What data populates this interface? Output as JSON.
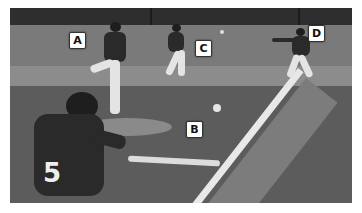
{
  "image": {
    "description": "Grayscale photo of a baseball game: batter wearing number 5 in foreground, pitcher on mound, fielders in background, with lettered callout labels",
    "batter_number": "5",
    "labels": [
      {
        "id": "A",
        "text": "A",
        "refers_to": "pitcher"
      },
      {
        "id": "B",
        "text": "B",
        "refers_to": "ball in flight near mound"
      },
      {
        "id": "C",
        "text": "C",
        "refers_to": "fielder running"
      },
      {
        "id": "D",
        "text": "D",
        "refers_to": "first baseman catching"
      }
    ]
  }
}
